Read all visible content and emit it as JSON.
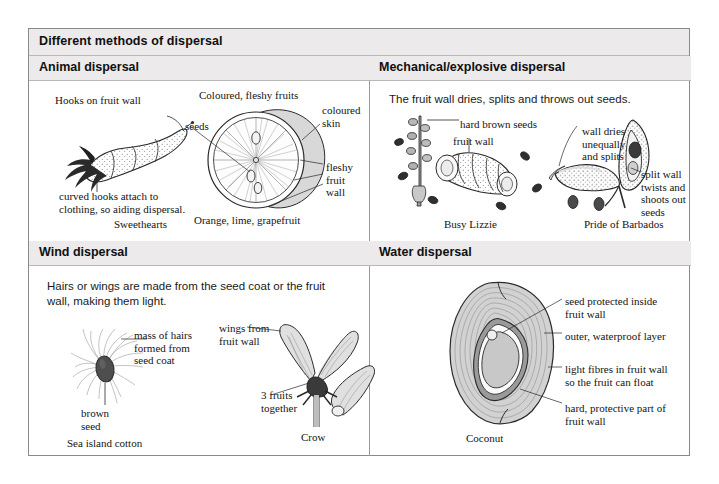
{
  "title": "Different methods of dispersal",
  "quadrants": {
    "animal": {
      "heading": "Animal dispersal",
      "sweethearts": {
        "hooks_label": "Hooks on fruit wall",
        "curved_label": "curved hooks attach to\nclothing, so aiding dispersal.",
        "caption": "Sweethearts"
      },
      "citrus": {
        "top_label": "Coloured, fleshy fruits",
        "seeds_label": "seeds",
        "skin_label": "coloured\nskin",
        "wall_label": "fleshy\nfruit\nwall",
        "caption": "Orange, lime, grapefruit"
      }
    },
    "mechanical": {
      "heading": "Mechanical/explosive dispersal",
      "intro": "The fruit wall dries, splits and throws out seeds.",
      "busy_lizzie": {
        "seeds_label": "hard brown seeds",
        "wall_label": "fruit wall",
        "caption": "Busy Lizzie"
      },
      "barbados": {
        "dries_label": "wall dries\nunequally\nand splits",
        "twists_label": "split wall\ntwists and\nshoots out\nseeds",
        "caption": "Pride of Barbados"
      }
    },
    "wind": {
      "heading": "Wind dispersal",
      "intro": "Hairs or wings are made from the seed coat or the fruit\n   wall, making them light.",
      "cotton": {
        "hairs_label": "mass of hairs\nformed from\nseed coat",
        "seed_label": "brown\nseed",
        "caption": "Sea island cotton"
      },
      "crow": {
        "wings_label": "wings from\nfruit wall",
        "fruits_label": "3 fruits\ntogether",
        "caption": "Crow"
      }
    },
    "water": {
      "heading": "Water dispersal",
      "coconut": {
        "seed_label": "seed protected inside\nfruit wall",
        "outer_label": "outer, waterproof layer",
        "fibres_label": "light fibres in fruit wall\nso the fruit can float",
        "hard_label": "hard, protective part of\nfruit wall",
        "caption": "Coconut"
      }
    }
  },
  "colors": {
    "page_background": "#ffffff",
    "border": "#8a8a8a",
    "band_background": "#eceaea",
    "divider": "#9a9a9a",
    "ink": "#141414",
    "fill_light": "#dcdcdc",
    "fill_mid": "#b4b4b4",
    "fill_dark": "#4a4a4a"
  }
}
